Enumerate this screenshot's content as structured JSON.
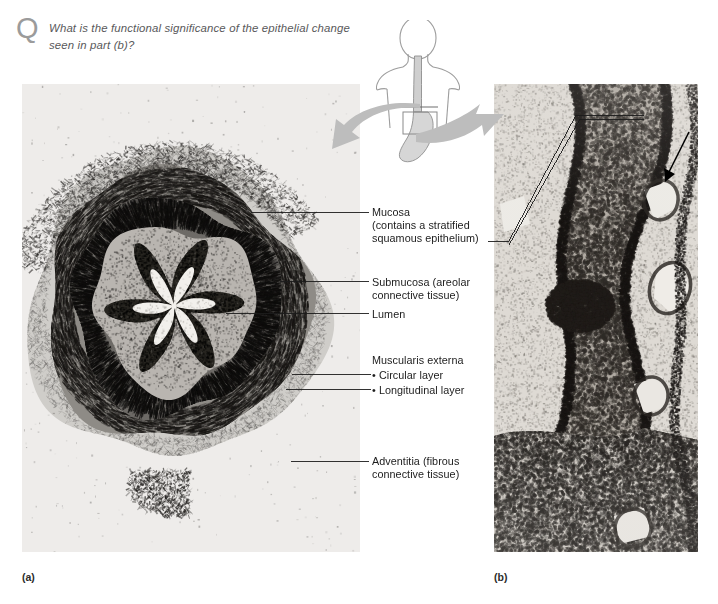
{
  "question": {
    "glyph": "Q",
    "text": "What is the functional significance of the epithelial change seen in part (b)?"
  },
  "figure": {
    "panel_a": {
      "caption": "(a)",
      "description": "Cross section light micrograph of the esophagus wall"
    },
    "panel_b": {
      "caption": "(b)",
      "description": "High magnification light micrograph of the esophageal mucosa and epithelium"
    }
  },
  "anatomy_inset": {
    "name": "human-torso-esophagus-stomach-diagram",
    "region_box_label": ""
  },
  "labels": {
    "mucosa": "Mucosa\n(contains a stratified\nsquamous epithelium)",
    "submucosa": "Submucosa (areolar\nconnective tissue)",
    "lumen": "Lumen",
    "muscularis_externa": "Muscularis externa",
    "circular_layer": "• Circular layer",
    "longitudinal_layer": "• Longitudinal layer",
    "adventitia": "Adventitia (fibrous\nconnective tissue)"
  },
  "colors": {
    "question_text": "#58585a",
    "q_glyph": "#9b9b9b",
    "label_text": "#1c1c1c",
    "leader_line": "#1c1c1c",
    "transfer_arrow": "#b6b6b6",
    "pointer_arrow": "#000000",
    "page_background": "#ffffff"
  }
}
